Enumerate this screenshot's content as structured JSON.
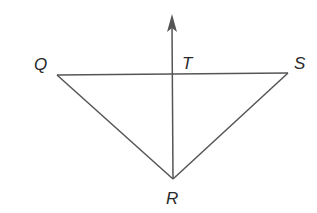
{
  "diagram": {
    "type": "geometry",
    "points": {
      "Q": {
        "label": "Q",
        "x": 57,
        "y": 75
      },
      "S": {
        "label": "S",
        "x": 288,
        "y": 73
      },
      "R": {
        "label": "R",
        "x": 173,
        "y": 179
      },
      "T": {
        "label": "T",
        "x": 172,
        "y": 74
      }
    },
    "segments": [
      "QS",
      "QR",
      "SR"
    ],
    "rays": [
      {
        "from": "R",
        "through": "T",
        "arrow_tip": {
          "x": 172,
          "y": 15
        }
      }
    ],
    "colors": {
      "line": "#555555",
      "label": "#2a2a2a"
    }
  }
}
